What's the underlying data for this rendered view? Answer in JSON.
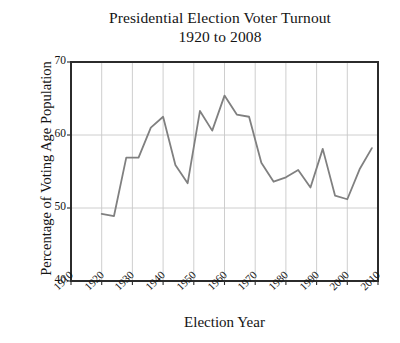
{
  "chart_data": {
    "type": "line",
    "title": "Presidential Election Voter Turnout",
    "subtitle": "1920 to 2008",
    "title_lines": [
      "Presidential Election Voter Turnout",
      "1920 to 2008"
    ],
    "xlabel": "Election Year",
    "ylabel": "Percentage of Voting Age Population",
    "xlim": [
      1910,
      2010
    ],
    "ylim": [
      40,
      70
    ],
    "xticks": [
      1910,
      1920,
      1930,
      1940,
      1950,
      1960,
      1970,
      1980,
      1990,
      2000,
      2010
    ],
    "yticks": [
      40,
      50,
      60,
      70
    ],
    "xtick_labels": [
      "1910",
      "1920",
      "1930",
      "1940",
      "1950",
      "1960",
      "1970",
      "1980",
      "1990",
      "2000",
      "2010"
    ],
    "ytick_labels": [
      "40",
      "50",
      "60",
      "70"
    ],
    "grid": true,
    "grid_color": "#c8c8c8",
    "legend": null,
    "line_color": "#808080",
    "line_width": 1.8,
    "axis_color": "#2b2b2b",
    "background": "#ffffff",
    "x": [
      1920,
      1924,
      1928,
      1932,
      1936,
      1940,
      1944,
      1948,
      1952,
      1956,
      1960,
      1964,
      1968,
      1972,
      1976,
      1980,
      1984,
      1988,
      1992,
      1996,
      2000,
      2004,
      2008
    ],
    "values": [
      49.2,
      48.9,
      56.9,
      56.9,
      61.0,
      62.5,
      55.9,
      53.4,
      63.3,
      60.6,
      65.4,
      62.8,
      62.5,
      56.2,
      53.6,
      54.2,
      55.2,
      52.8,
      58.1,
      51.7,
      51.2,
      55.3,
      58.2
    ],
    "series": [
      {
        "name": "Voter turnout",
        "values": [
          49.2,
          48.9,
          56.9,
          56.9,
          61.0,
          62.5,
          55.9,
          53.4,
          63.3,
          60.6,
          65.4,
          62.8,
          62.5,
          56.2,
          53.6,
          54.2,
          55.2,
          52.8,
          58.1,
          51.7,
          51.2,
          55.3,
          58.2
        ]
      }
    ]
  }
}
